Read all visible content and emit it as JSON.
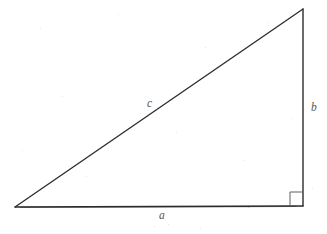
{
  "figure": {
    "name": "right-triangle-diagram",
    "background_color": "#ffffff",
    "width": 327,
    "height": 234,
    "line_color": "#2b2b2b",
    "label_color": "#555555",
    "fringe_blue": "#2f3f7a",
    "fringe_red": "#7a3a3a"
  },
  "geometry": {
    "vertices": {
      "left": {
        "x": 15,
        "y": 207
      },
      "bottom_right": {
        "x": 303,
        "y": 206
      },
      "apex": {
        "x": 303,
        "y": 9
      }
    },
    "right_angle_marker": {
      "x": 290,
      "y": 191,
      "size": 13,
      "at_vertex": "bottom_right"
    }
  },
  "labels": {
    "hypotenuse": "c",
    "base": "a",
    "vertical": "b"
  }
}
